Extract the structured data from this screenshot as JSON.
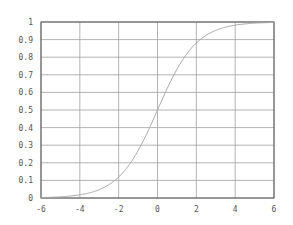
{
  "chart_data": {
    "type": "line",
    "title": "",
    "xlabel": "",
    "ylabel": "",
    "xlim": [
      -6,
      6
    ],
    "ylim": [
      0,
      1
    ],
    "grid": true,
    "legend": null,
    "x_ticks": [
      "-6",
      "-4",
      "-2",
      "0",
      "2",
      "4",
      "6"
    ],
    "y_ticks": [
      "0",
      "0.1",
      "0.2",
      "0.3",
      "0.4",
      "0.5",
      "0.6",
      "0.7",
      "0.8",
      "0.9",
      "1"
    ],
    "series": [
      {
        "name": "sigmoid",
        "function": "1/(1+exp(-x))",
        "x": [
          -6,
          -5,
          -4,
          -3,
          -2,
          -1,
          0,
          1,
          2,
          3,
          4,
          5,
          6
        ],
        "values": [
          0.0025,
          0.0067,
          0.018,
          0.047,
          0.119,
          0.269,
          0.5,
          0.731,
          0.881,
          0.953,
          0.982,
          0.993,
          0.9975
        ]
      }
    ],
    "colors": {
      "curve": "#a8a8a8",
      "grid": "#a0a0a0",
      "frame": "#555555"
    }
  }
}
